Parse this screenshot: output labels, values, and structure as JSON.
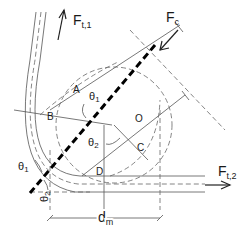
{
  "diagram": {
    "type": "rope wrapped around pulley free-body diagram",
    "forces": {
      "ft1": {
        "main": "F",
        "sub": "t,1"
      },
      "ft2": {
        "main": "F",
        "sub": "t,2"
      },
      "fc": {
        "main": "F",
        "sub": "c"
      }
    },
    "points": {
      "a": "A",
      "b": "B",
      "c": "C",
      "d": "D",
      "o": "O"
    },
    "angles": {
      "theta1_center": {
        "main": "θ",
        "sub": "1"
      },
      "theta2_center": {
        "main": "θ",
        "sub": "2"
      },
      "theta1_left": {
        "main": "θ",
        "sub": "1"
      },
      "theta2_left": {
        "main": "θ",
        "sub": "2"
      }
    },
    "dimension": {
      "main": "d",
      "sub": "m"
    },
    "colors": {
      "line": "#555555",
      "thick": "#000000",
      "text": "#1a1a1a"
    }
  }
}
